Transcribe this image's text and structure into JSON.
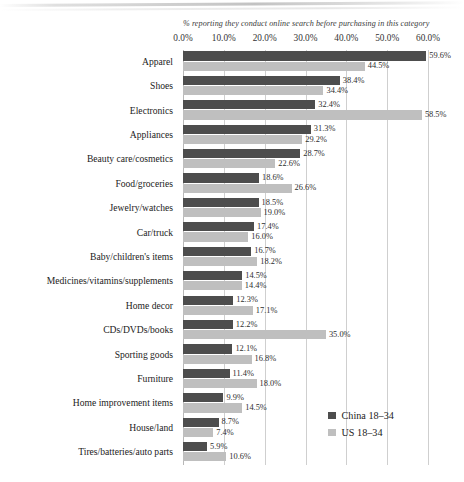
{
  "chart_data": {
    "type": "bar",
    "orientation": "horizontal",
    "title": "",
    "subtitle": "% reporting they conduct online search before purchasing in this category",
    "xlabel": "",
    "ylabel": "",
    "xlim": [
      0,
      60
    ],
    "grid": true,
    "legend_position": "bottom-right",
    "tick_labels": [
      "0.0%",
      "10.0%",
      "20.0%",
      "30.0%",
      "40.0%",
      "50.0%",
      "60.0%"
    ],
    "tick_values": [
      0,
      10,
      20,
      30,
      40,
      50,
      60
    ],
    "categories": [
      "Apparel",
      "Shoes",
      "Electronics",
      "Appliances",
      "Beauty care/cosmetics",
      "Food/groceries",
      "Jewelry/watches",
      "Car/truck",
      "Baby/children's items",
      "Medicines/vitamins/supplements",
      "Home decor",
      "CDs/DVDs/books",
      "Sporting goods",
      "Furniture",
      "Home improvement items",
      "House/land",
      "Tires/batteries/auto parts"
    ],
    "series": [
      {
        "name": "China 18–34",
        "color": "#4d4d4d",
        "values": [
          59.6,
          38.4,
          32.4,
          31.3,
          28.7,
          18.6,
          18.5,
          17.4,
          16.7,
          14.5,
          12.3,
          12.2,
          12.1,
          11.4,
          9.9,
          8.7,
          5.9
        ],
        "labels": [
          "59.6%",
          "38.4%",
          "32.4%",
          "31.3%",
          "28.7%",
          "18.6%",
          "18.5%",
          "17.4%",
          "16.7%",
          "14.5%",
          "12.3%",
          "12.2%",
          "12.1%",
          "11.4%",
          "9.9%",
          "8.7%",
          "5.9%"
        ]
      },
      {
        "name": "US 18–34",
        "color": "#bfbfbf",
        "values": [
          44.5,
          34.4,
          58.5,
          29.2,
          22.6,
          26.6,
          19.0,
          16.0,
          18.2,
          14.4,
          17.1,
          35.0,
          16.8,
          18.0,
          14.5,
          7.4,
          10.6
        ],
        "labels": [
          "44.5%",
          "34.4%",
          "58.5%",
          "29.2%",
          "22.6%",
          "26.6%",
          "19.0%",
          "16.0%",
          "18.2%",
          "14.4%",
          "17.1%",
          "35.0%",
          "16.8%",
          "18.0%",
          "14.5%",
          "7.4%",
          "10.6%"
        ]
      }
    ]
  }
}
